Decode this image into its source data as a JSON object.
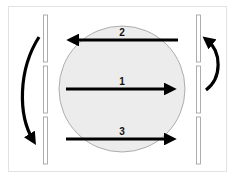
{
  "diagram": {
    "colors": {
      "frame_border": "#e2e2e2",
      "circle_fill": "#ececec",
      "circle_stroke": "#9a9a9a",
      "bar_stroke": "#9a9a9a",
      "arrow": "#000000",
      "label": "#111111"
    },
    "arrows": [
      {
        "id": "1",
        "label": "1",
        "direction": "right",
        "y": 89
      },
      {
        "id": "2",
        "label": "2",
        "direction": "left",
        "y": 40
      },
      {
        "id": "3",
        "label": "3",
        "direction": "right",
        "y": 138
      }
    ],
    "curved_arrows": [
      {
        "side": "left",
        "direction": "down"
      },
      {
        "side": "right",
        "direction": "up"
      }
    ],
    "bars": {
      "left_segments": 3,
      "right_segments": 3
    }
  }
}
